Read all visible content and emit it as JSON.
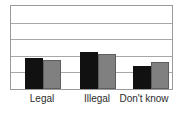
{
  "chart_data": {
    "type": "bar",
    "title": "",
    "subtitle": "",
    "xlabel": "",
    "ylabel": "",
    "categories": [
      "Legal",
      "Illegal",
      "Don't know"
    ],
    "series": [
      {
        "name": "series-1",
        "color": "#111111",
        "values": [
          1.85,
          2.2,
          1.4
        ]
      },
      {
        "name": "series-2",
        "color": "#808080",
        "values": [
          1.75,
          2.1,
          1.6
        ]
      }
    ],
    "ylim": [
      0,
      5
    ],
    "yticks": [
      0,
      1,
      2,
      3,
      4,
      5
    ],
    "ytick_labels": [
      "",
      "",
      "",
      "",
      "",
      ""
    ],
    "gridlines": {
      "horizontal": true,
      "vertical": false,
      "count": 4
    },
    "legend": {
      "visible": false,
      "position": "none"
    },
    "annotations": [],
    "frame": {
      "visible": true,
      "color": "#9a9a9a"
    }
  },
  "axis": {
    "labels": [
      "Legal",
      "Illegal",
      "Don't know"
    ]
  },
  "colors": {
    "series_dark": "#111111",
    "series_gray": "#808080",
    "grid": "#a8a8a8",
    "frame": "#9a9a9a",
    "background": "#ffffff",
    "label_text": "#2b2b2b"
  }
}
